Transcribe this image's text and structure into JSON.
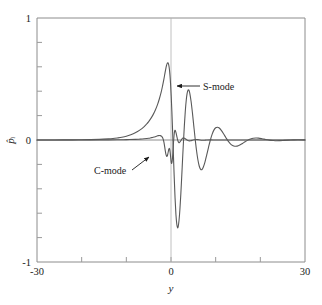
{
  "chart_data": {
    "type": "line",
    "title": "",
    "xlabel": "y",
    "ylabel": "p̂ᵢ",
    "xlim": [
      -30,
      30
    ],
    "ylim": [
      -1,
      1
    ],
    "grid": false,
    "legend": "none",
    "x_ticks": [
      -30,
      30
    ],
    "x_tick_labels": [
      "-30",
      "30"
    ],
    "x_minor_ticks": [
      -20,
      -10,
      0,
      10,
      20
    ],
    "y_ticks": [
      -1,
      0,
      1
    ],
    "y_tick_labels": [
      "-1",
      "0",
      "1"
    ],
    "y_minor_ticks": [
      -0.8,
      -0.6,
      -0.4,
      -0.2,
      0.2,
      0.4,
      0.6,
      0.8
    ],
    "zero_line_horizontal": true,
    "zero_line_vertical": true,
    "series": [
      {
        "name": "S-mode",
        "color": "#595959",
        "points": [
          [
            -30.0,
            0.0
          ],
          [
            -28.0,
            0.0
          ],
          [
            -26.0,
            0.0
          ],
          [
            -24.0,
            0.001
          ],
          [
            -22.0,
            0.001
          ],
          [
            -20.0,
            0.002
          ],
          [
            -18.0,
            0.003
          ],
          [
            -16.0,
            0.005
          ],
          [
            -14.0,
            0.009
          ],
          [
            -13.0,
            0.012
          ],
          [
            -12.0,
            0.017
          ],
          [
            -11.0,
            0.023
          ],
          [
            -10.0,
            0.031
          ],
          [
            -9.0,
            0.043
          ],
          [
            -8.0,
            0.059
          ],
          [
            -7.0,
            0.081
          ],
          [
            -6.0,
            0.11
          ],
          [
            -5.5,
            0.129
          ],
          [
            -5.0,
            0.151
          ],
          [
            -4.5,
            0.177
          ],
          [
            -4.0,
            0.208
          ],
          [
            -3.5,
            0.246
          ],
          [
            -3.0,
            0.292
          ],
          [
            -2.6,
            0.338
          ],
          [
            -2.2,
            0.392
          ],
          [
            -1.9,
            0.442
          ],
          [
            -1.6,
            0.497
          ],
          [
            -1.4,
            0.538
          ],
          [
            -1.2,
            0.577
          ],
          [
            -1.0,
            0.611
          ],
          [
            -0.85,
            0.628
          ],
          [
            -0.7,
            0.633
          ],
          [
            -0.55,
            0.622
          ],
          [
            -0.4,
            0.592
          ],
          [
            -0.25,
            0.54
          ],
          [
            -0.1,
            0.462
          ],
          [
            0.05,
            0.358
          ],
          [
            0.2,
            0.23
          ],
          [
            0.35,
            0.082
          ],
          [
            0.5,
            -0.078
          ],
          [
            0.7,
            -0.286
          ],
          [
            0.9,
            -0.47
          ],
          [
            1.1,
            -0.608
          ],
          [
            1.3,
            -0.691
          ],
          [
            1.45,
            -0.718
          ],
          [
            1.6,
            -0.712
          ],
          [
            1.8,
            -0.658
          ],
          [
            2.0,
            -0.565
          ],
          [
            2.2,
            -0.442
          ],
          [
            2.4,
            -0.3
          ],
          [
            2.6,
            -0.152
          ],
          [
            2.8,
            -0.008
          ],
          [
            3.0,
            0.124
          ],
          [
            3.2,
            0.236
          ],
          [
            3.4,
            0.322
          ],
          [
            3.6,
            0.38
          ],
          [
            3.8,
            0.408
          ],
          [
            4.0,
            0.409
          ],
          [
            4.2,
            0.385
          ],
          [
            4.5,
            0.316
          ],
          [
            4.8,
            0.222
          ],
          [
            5.1,
            0.116
          ],
          [
            5.4,
            0.012
          ],
          [
            5.7,
            -0.082
          ],
          [
            6.0,
            -0.158
          ],
          [
            6.3,
            -0.211
          ],
          [
            6.6,
            -0.239
          ],
          [
            6.9,
            -0.243
          ],
          [
            7.2,
            -0.226
          ],
          [
            7.6,
            -0.181
          ],
          [
            8.0,
            -0.122
          ],
          [
            8.4,
            -0.06
          ],
          [
            8.8,
            -0.002
          ],
          [
            9.2,
            0.046
          ],
          [
            9.6,
            0.081
          ],
          [
            10.0,
            0.1
          ],
          [
            10.4,
            0.105
          ],
          [
            10.8,
            0.098
          ],
          [
            11.3,
            0.077
          ],
          [
            11.8,
            0.049
          ],
          [
            12.3,
            0.019
          ],
          [
            12.8,
            -0.009
          ],
          [
            13.3,
            -0.031
          ],
          [
            13.8,
            -0.045
          ],
          [
            14.3,
            -0.051
          ],
          [
            14.8,
            -0.05
          ],
          [
            15.4,
            -0.041
          ],
          [
            16.0,
            -0.028
          ],
          [
            16.6,
            -0.014
          ],
          [
            17.2,
            -0.001
          ],
          [
            17.8,
            0.008
          ],
          [
            18.4,
            0.014
          ],
          [
            19.0,
            0.016
          ],
          [
            19.6,
            0.015
          ],
          [
            20.4,
            0.01
          ],
          [
            21.2,
            0.004
          ],
          [
            22.0,
            -0.001
          ],
          [
            22.8,
            -0.004
          ],
          [
            23.6,
            -0.006
          ],
          [
            24.4,
            -0.005
          ],
          [
            25.4,
            -0.003
          ],
          [
            26.4,
            -0.001
          ],
          [
            27.4,
            0.001
          ],
          [
            28.4,
            0.002
          ],
          [
            30.0,
            0.001
          ]
        ]
      },
      {
        "name": "C-mode",
        "color": "#595959",
        "points": [
          [
            -30.0,
            0.0
          ],
          [
            -26.0,
            0.0
          ],
          [
            -22.0,
            0.0
          ],
          [
            -18.0,
            0.001
          ],
          [
            -15.0,
            0.001
          ],
          [
            -12.0,
            0.002
          ],
          [
            -10.0,
            0.003
          ],
          [
            -8.0,
            0.005
          ],
          [
            -7.0,
            0.007
          ],
          [
            -6.0,
            0.01
          ],
          [
            -5.0,
            0.014
          ],
          [
            -4.5,
            0.018
          ],
          [
            -4.0,
            0.022
          ],
          [
            -3.5,
            0.027
          ],
          [
            -3.2,
            0.031
          ],
          [
            -3.0,
            0.034
          ],
          [
            -2.8,
            0.036
          ],
          [
            -2.6,
            0.037
          ],
          [
            -2.4,
            0.036
          ],
          [
            -2.2,
            0.033
          ],
          [
            -2.0,
            0.026
          ],
          [
            -1.85,
            0.016
          ],
          [
            -1.7,
            0.0
          ],
          [
            -1.6,
            -0.016
          ],
          [
            -1.5,
            -0.036
          ],
          [
            -1.4,
            -0.059
          ],
          [
            -1.3,
            -0.083
          ],
          [
            -1.2,
            -0.105
          ],
          [
            -1.1,
            -0.122
          ],
          [
            -1.0,
            -0.132
          ],
          [
            -0.9,
            -0.134
          ],
          [
            -0.8,
            -0.127
          ],
          [
            -0.7,
            -0.112
          ],
          [
            -0.6,
            -0.094
          ],
          [
            -0.5,
            -0.078
          ],
          [
            -0.42,
            -0.07
          ],
          [
            -0.35,
            -0.07
          ],
          [
            -0.28,
            -0.079
          ],
          [
            -0.2,
            -0.098
          ],
          [
            -0.12,
            -0.124
          ],
          [
            -0.05,
            -0.152
          ],
          [
            0.02,
            -0.176
          ],
          [
            0.1,
            -0.19
          ],
          [
            0.18,
            -0.19
          ],
          [
            0.26,
            -0.174
          ],
          [
            0.34,
            -0.143
          ],
          [
            0.42,
            -0.101
          ],
          [
            0.5,
            -0.053
          ],
          [
            0.6,
            0.0
          ],
          [
            0.7,
            0.043
          ],
          [
            0.8,
            0.07
          ],
          [
            0.9,
            0.08
          ],
          [
            1.0,
            0.075
          ],
          [
            1.15,
            0.056
          ],
          [
            1.3,
            0.03
          ],
          [
            1.45,
            0.006
          ],
          [
            1.6,
            -0.012
          ],
          [
            1.75,
            -0.021
          ],
          [
            1.9,
            -0.021
          ],
          [
            2.1,
            -0.012
          ],
          [
            2.3,
            0.0
          ],
          [
            2.5,
            0.011
          ],
          [
            2.7,
            0.016
          ],
          [
            2.9,
            0.016
          ],
          [
            3.2,
            0.01
          ],
          [
            3.5,
            0.002
          ],
          [
            3.8,
            -0.004
          ],
          [
            4.1,
            -0.007
          ],
          [
            4.4,
            -0.006
          ],
          [
            4.8,
            -0.002
          ],
          [
            5.2,
            0.002
          ],
          [
            5.6,
            0.004
          ],
          [
            6.0,
            0.003
          ],
          [
            6.5,
            0.0
          ],
          [
            7.0,
            -0.002
          ],
          [
            7.5,
            -0.002
          ],
          [
            8.0,
            0.0
          ],
          [
            9.0,
            0.001
          ],
          [
            10.0,
            0.0
          ],
          [
            12.0,
            0.0
          ],
          [
            15.0,
            0.0
          ],
          [
            20.0,
            0.0
          ],
          [
            25.0,
            0.0
          ],
          [
            30.0,
            0.0
          ]
        ]
      }
    ],
    "annotations": [
      {
        "name": "s-mode",
        "label": "S-mode",
        "label_x": 203,
        "label_y": 88,
        "arrow_from_x": 200,
        "arrow_from_y": 86,
        "arrow_to_x": 177,
        "arrow_to_y": 86
      },
      {
        "name": "c-mode",
        "label": "C-mode",
        "label_x": 94,
        "label_y": 172,
        "arrow_from_x": 132,
        "arrow_from_y": 170,
        "arrow_to_x": 149,
        "arrow_to_y": 157
      }
    ]
  },
  "axis": {
    "y_top_label": "1",
    "y_zero_label": "0",
    "y_bottom_label": "-1",
    "y_title": "p̂ᵢ",
    "x_left_label": "-30",
    "x_right_label": "30",
    "x_center_label": "0",
    "x_title": "y"
  },
  "style": {
    "curve_color": "#595959",
    "axis_color": "#8c8c8c",
    "text_color": "#1a1a1a",
    "background": "#ffffff"
  }
}
